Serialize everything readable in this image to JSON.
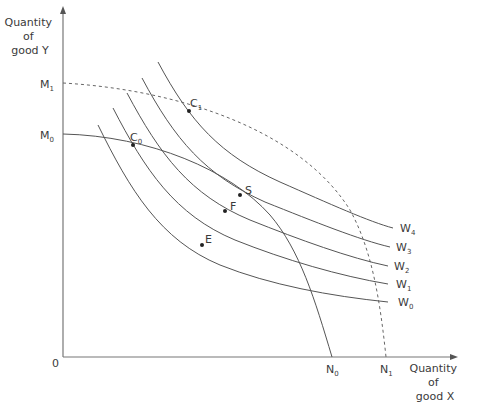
{
  "diagram": {
    "y_axis_label": [
      "Quantity",
      "of",
      "good Y"
    ],
    "x_axis_label": [
      "Quantity",
      "of",
      "good X"
    ],
    "origin_label": "0",
    "intercepts": {
      "M0": {
        "base": "M",
        "sub": "0"
      },
      "M1": {
        "base": "M",
        "sub": "1"
      },
      "N0": {
        "base": "N",
        "sub": "0"
      },
      "N1": {
        "base": "N",
        "sub": "1"
      }
    },
    "indifference_curves": [
      {
        "base": "W",
        "sub": "0"
      },
      {
        "base": "W",
        "sub": "1"
      },
      {
        "base": "W",
        "sub": "2"
      },
      {
        "base": "W",
        "sub": "3"
      },
      {
        "base": "W",
        "sub": "4"
      }
    ],
    "points": {
      "C0": {
        "base": "C",
        "sub": "0"
      },
      "C1": {
        "base": "C",
        "sub": "1"
      },
      "S": {
        "base": "S"
      },
      "F": {
        "base": "F"
      },
      "E": {
        "base": "E"
      }
    },
    "curves": {
      "ppf_initial": "M0–N0 (solid)",
      "ppf_expanded": "M1–N1 (dashed)"
    }
  }
}
